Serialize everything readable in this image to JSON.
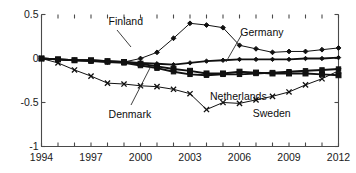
{
  "chart_data": {
    "type": "line",
    "title": "",
    "xlabel": "",
    "ylabel": "",
    "xlim": [
      1994,
      2012
    ],
    "ylim": [
      -1,
      0.5
    ],
    "grid": false,
    "legend_position": "inline-annotations",
    "x": [
      1994,
      1995,
      1996,
      1997,
      1998,
      1999,
      2000,
      2001,
      2002,
      2003,
      2004,
      2005,
      2006,
      2007,
      2008,
      2009,
      2010,
      2011,
      2012
    ],
    "yticks": [
      0.5,
      0,
      -0.5,
      -1
    ],
    "ytick_labels": [
      "0.5",
      "0",
      "-0.5",
      "-1"
    ],
    "xticks": [
      1994,
      1995,
      1996,
      1997,
      1998,
      1999,
      2000,
      2001,
      2002,
      2003,
      2004,
      2005,
      2006,
      2007,
      2008,
      2009,
      2010,
      2011,
      2012
    ],
    "xtick_labels_shown": [
      "1994",
      "1997",
      "2000",
      "2003",
      "2006",
      "2009",
      "2012"
    ],
    "series": [
      {
        "name": "Finland",
        "marker": "diamond",
        "line_weight": "thin",
        "values": [
          0.0,
          -0.01,
          -0.02,
          -0.03,
          -0.04,
          -0.04,
          0.0,
          0.07,
          0.23,
          0.4,
          0.38,
          0.35,
          0.15,
          0.11,
          0.07,
          0.08,
          0.08,
          0.1,
          0.12
        ]
      },
      {
        "name": "Germany",
        "marker": "diamond-filled",
        "line_weight": "thick",
        "values": [
          0.0,
          -0.01,
          -0.02,
          -0.02,
          -0.03,
          -0.04,
          -0.05,
          -0.06,
          -0.07,
          -0.05,
          -0.03,
          -0.02,
          -0.01,
          -0.01,
          -0.01,
          -0.01,
          0.0,
          0.0,
          0.01
        ]
      },
      {
        "name": "Netherlands",
        "marker": "square",
        "line_weight": "thick",
        "values": [
          0.0,
          -0.01,
          -0.02,
          -0.02,
          -0.03,
          -0.04,
          -0.06,
          -0.09,
          -0.12,
          -0.14,
          -0.17,
          -0.17,
          -0.15,
          -0.16,
          -0.17,
          -0.17,
          -0.17,
          -0.18,
          -0.19
        ]
      },
      {
        "name": "Denmark",
        "marker": "square-small",
        "line_weight": "thick",
        "values": [
          0.0,
          -0.01,
          -0.02,
          -0.03,
          -0.04,
          -0.05,
          -0.08,
          -0.11,
          -0.15,
          -0.18,
          -0.19,
          -0.18,
          -0.18,
          -0.17,
          -0.16,
          -0.15,
          -0.14,
          -0.13,
          -0.12
        ]
      },
      {
        "name": "Sweden",
        "marker": "x",
        "line_weight": "thin",
        "values": [
          0.0,
          -0.05,
          -0.13,
          -0.2,
          -0.28,
          -0.29,
          -0.31,
          -0.32,
          -0.35,
          -0.4,
          -0.58,
          -0.5,
          -0.51,
          -0.47,
          -0.43,
          -0.38,
          -0.3,
          -0.23,
          -0.14
        ]
      }
    ],
    "annotations": [
      {
        "text": "Finland",
        "x_frac": 0.305,
        "y_frac": 0.095,
        "has_leader": true
      },
      {
        "text": "Germany",
        "x_frac": 0.675,
        "y_frac": 0.155,
        "has_leader": true
      },
      {
        "text": "Netherlands",
        "x_frac": 0.59,
        "y_frac": 0.525,
        "has_leader": false
      },
      {
        "text": "Denmark",
        "x_frac": 0.305,
        "y_frac": 0.63,
        "has_leader": true
      },
      {
        "text": "Sweden",
        "x_frac": 0.71,
        "y_frac": 0.625,
        "has_leader": false
      }
    ]
  }
}
